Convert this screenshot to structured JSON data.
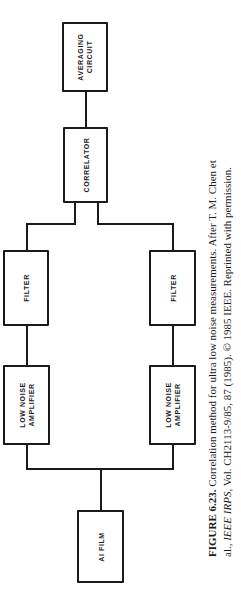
{
  "diagram": {
    "blocks": {
      "averaging": [
        "AVERAGING",
        "CIRCUIT"
      ],
      "correlator": [
        "CORRELATOR"
      ],
      "filter_left": [
        "FILTER"
      ],
      "filter_right": [
        "FILTER"
      ],
      "lna_left": [
        "LOW NOISE",
        "AMPLIFIER"
      ],
      "lna_right": [
        "LOW NOISE",
        "AMPLIFIER"
      ],
      "ai_film": [
        "AI FILM"
      ]
    },
    "flow": [
      "AI FILM -> LOW NOISE AMPLIFIER (x2, parallel)",
      "LOW NOISE AMPLIFIER -> FILTER",
      "FILTER (x2) -> CORRELATOR",
      "CORRELATOR -> AVERAGING CIRCUIT"
    ]
  },
  "caption": {
    "label": "FIGURE 6.23.",
    "line1_text": " Correlation method for ultra low noise measurements. After T. M. Chen et",
    "line2_prefix": "al., ",
    "line2_journal": "IEEE IRPS",
    "line2_suffix": ", Vol. CH2113-9/85, 87 (1985). © 1985 IEEE. Reprinted with permission."
  }
}
